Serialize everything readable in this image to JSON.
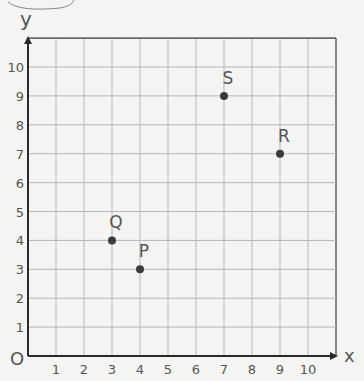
{
  "chart_data": {
    "type": "scatter",
    "title": "",
    "xlabel": "x",
    "ylabel": "y",
    "xlim": [
      0,
      11
    ],
    "ylim": [
      0,
      11
    ],
    "grid": true,
    "x_ticks": [
      "1",
      "2",
      "3",
      "4",
      "5",
      "6",
      "7",
      "8",
      "9",
      "10"
    ],
    "y_ticks": [
      "1",
      "2",
      "3",
      "4",
      "5",
      "6",
      "7",
      "8",
      "9",
      "10"
    ],
    "origin_label": "O",
    "points": [
      {
        "label": "P",
        "x": 4,
        "y": 3
      },
      {
        "label": "Q",
        "x": 3,
        "y": 4
      },
      {
        "label": "R",
        "x": 9,
        "y": 7
      },
      {
        "label": "S",
        "x": 7,
        "y": 9
      }
    ]
  },
  "colors": {
    "paper": "#f4f4f2",
    "grid": "#b5b5b5",
    "axis": "#2a2a2a",
    "point": "#3a3a3a",
    "pencil": "#555555"
  }
}
